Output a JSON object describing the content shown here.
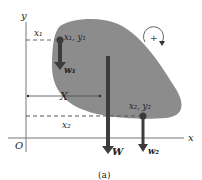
{
  "figure": {
    "caption": "(a)",
    "axes": {
      "x_label": "x",
      "y_label": "y",
      "origin_label": "O"
    },
    "points": {
      "p1_label": "x₁, y₁",
      "p2_label": "x₂, y₂"
    },
    "dimensions": {
      "x1_label": "x₁",
      "x2_label": "x₂",
      "X_label": "X"
    },
    "forces": {
      "w1_label": "w₁",
      "w2_label": "w₂",
      "W_label": "W"
    },
    "rotation": {
      "sign": "+",
      "direction": "clockwise"
    },
    "colors": {
      "body_fill": "#8c8c8c",
      "arrow": "#3c3c3c",
      "axis": "#777777",
      "text": "#222222"
    }
  }
}
